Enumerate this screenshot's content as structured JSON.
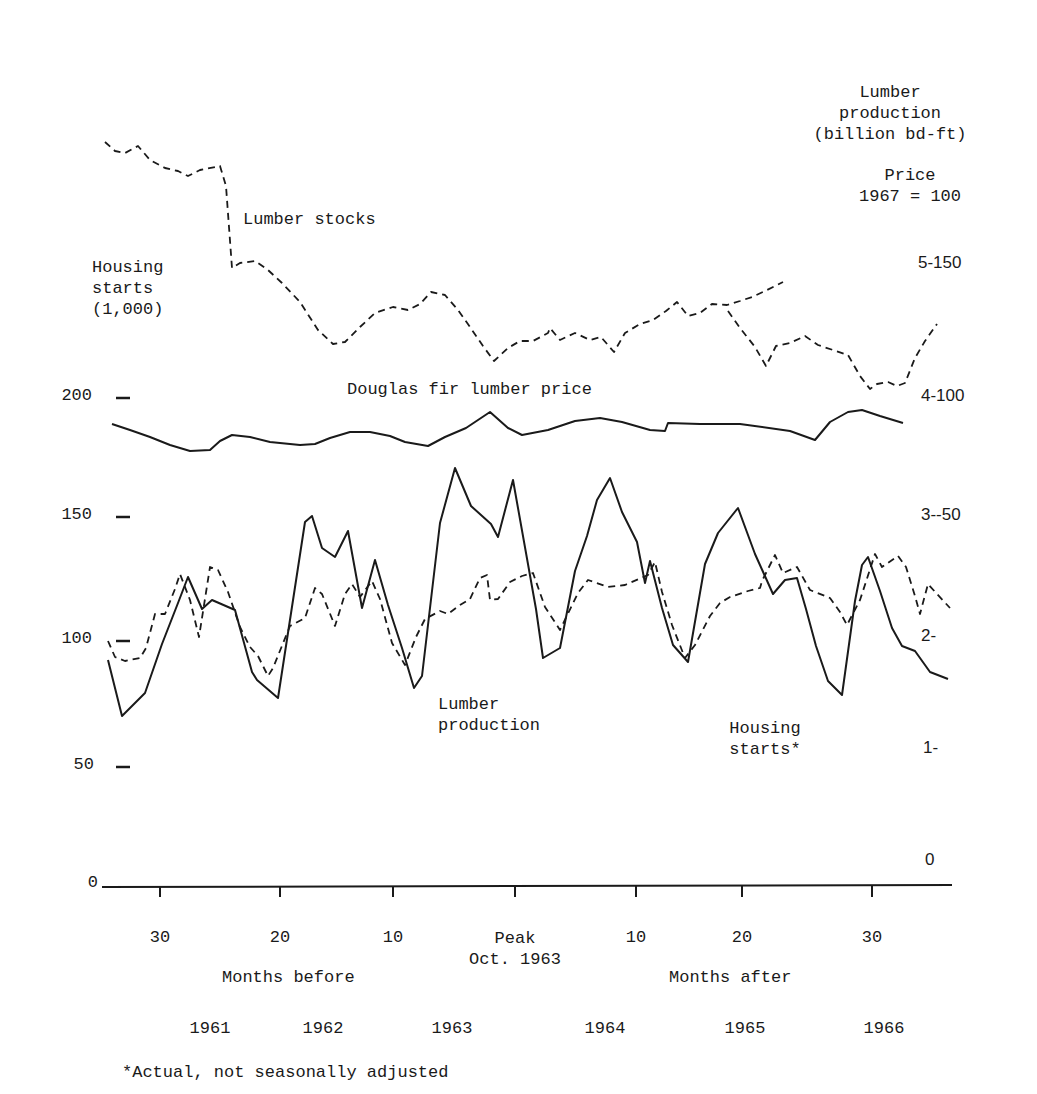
{
  "chart_data": {
    "type": "line",
    "title": "",
    "labels": {
      "right_axis_title_1": "Lumber\nproduction\n(billion bd-ft)",
      "right_axis_title_2": "Price\n1967 = 100",
      "left_axis_title": "Housing\nstarts\n(1,000)",
      "lumber_stocks": "Lumber stocks",
      "douglas_fir": "Douglas fir lumber price",
      "lumber_production": "Lumber\nproduction",
      "housing_starts": "Housing\nstarts*",
      "months_before": "Months before",
      "months_after": "Months after",
      "peak": "Peak\nOct. 1963",
      "footnote": "*Actual, not seasonally adjusted"
    },
    "left_axis": {
      "label": "Housing starts (1,000)",
      "ticks": [
        {
          "value": "200",
          "y": 398
        },
        {
          "value": "150",
          "y": 517
        },
        {
          "value": "100",
          "y": 641
        },
        {
          "value": "50",
          "y": 767
        },
        {
          "value": "0",
          "y": 885
        }
      ]
    },
    "right_axis": {
      "label": "Lumber production (billion bd-ft) / Price 1967 = 100",
      "ticks": [
        {
          "value": "5-150",
          "y": 265
        },
        {
          "value": "4-100",
          "y": 398
        },
        {
          "value": "3--50",
          "y": 517
        },
        {
          "value": "2-",
          "y": 638
        },
        {
          "value": "1-",
          "y": 750
        },
        {
          "value": "0",
          "y": 862
        }
      ]
    },
    "x_axis": {
      "ticks": [
        {
          "label": "30",
          "x": 160
        },
        {
          "label": "20",
          "x": 280
        },
        {
          "label": "10",
          "x": 393
        },
        {
          "label": "",
          "x": 515
        },
        {
          "label": "10",
          "x": 636
        },
        {
          "label": "20",
          "x": 742
        },
        {
          "label": "30",
          "x": 872
        }
      ],
      "peak_label": "Peak",
      "peak_date": "Oct. 1963",
      "years": [
        {
          "label": "1961",
          "x": 210
        },
        {
          "label": "1962",
          "x": 323
        },
        {
          "label": "1963",
          "x": 452
        },
        {
          "label": "1964",
          "x": 605
        },
        {
          "label": "1965",
          "x": 745
        },
        {
          "label": "1966",
          "x": 884
        }
      ]
    },
    "series": [
      {
        "name": "Lumber stocks",
        "style": "dashed",
        "points": [
          [
            105,
            142
          ],
          [
            115,
            151
          ],
          [
            125,
            153
          ],
          [
            138,
            146
          ],
          [
            150,
            160
          ],
          [
            165,
            168
          ],
          [
            178,
            171
          ],
          [
            188,
            176
          ],
          [
            200,
            170
          ],
          [
            220,
            166
          ],
          [
            226,
            186
          ],
          [
            232,
            268
          ],
          [
            240,
            263
          ],
          [
            255,
            261
          ],
          [
            268,
            270
          ],
          [
            282,
            283
          ],
          [
            300,
            302
          ],
          [
            318,
            330
          ],
          [
            333,
            344
          ],
          [
            345,
            342
          ],
          [
            360,
            327
          ],
          [
            375,
            313
          ],
          [
            393,
            307
          ],
          [
            408,
            310
          ],
          [
            420,
            304
          ],
          [
            431,
            292
          ],
          [
            445,
            295
          ],
          [
            458,
            310
          ],
          [
            470,
            327
          ],
          [
            483,
            346
          ],
          [
            494,
            361
          ],
          [
            508,
            348
          ],
          [
            520,
            341
          ],
          [
            533,
            341
          ],
          [
            548,
            333
          ],
          [
            550,
            328
          ],
          [
            560,
            340
          ],
          [
            575,
            333
          ],
          [
            590,
            340
          ],
          [
            601,
            337
          ],
          [
            614,
            352
          ],
          [
            625,
            333
          ],
          [
            640,
            324
          ],
          [
            653,
            320
          ],
          [
            666,
            311
          ],
          [
            677,
            302
          ],
          [
            688,
            316
          ],
          [
            700,
            313
          ],
          [
            712,
            304
          ],
          [
            727,
            305
          ],
          [
            740,
            301
          ],
          [
            752,
            297
          ],
          [
            765,
            291
          ],
          [
            783,
            282
          ]
        ],
        "color": "#1a1a1a"
      },
      {
        "name": "Lumber stocks (cont.)",
        "style": "dashed",
        "points": [
          [
            728,
            311
          ],
          [
            740,
            328
          ],
          [
            755,
            347
          ],
          [
            766,
            366
          ],
          [
            776,
            346
          ],
          [
            790,
            343
          ],
          [
            805,
            336
          ],
          [
            818,
            345
          ],
          [
            833,
            350
          ],
          [
            848,
            355
          ],
          [
            860,
            376
          ],
          [
            870,
            389
          ],
          [
            877,
            384
          ],
          [
            888,
            382
          ],
          [
            897,
            386
          ],
          [
            905,
            383
          ],
          [
            915,
            358
          ],
          [
            925,
            341
          ],
          [
            937,
            324
          ]
        ],
        "color": "#1a1a1a"
      },
      {
        "name": "Douglas fir lumber price",
        "style": "solid",
        "points": [
          [
            112,
            424
          ],
          [
            130,
            430
          ],
          [
            150,
            437
          ],
          [
            170,
            445
          ],
          [
            190,
            451
          ],
          [
            210,
            450
          ],
          [
            220,
            441
          ],
          [
            232,
            435
          ],
          [
            250,
            437
          ],
          [
            270,
            442
          ],
          [
            280,
            443
          ],
          [
            300,
            445
          ],
          [
            315,
            444
          ],
          [
            330,
            438
          ],
          [
            350,
            432
          ],
          [
            370,
            432
          ],
          [
            390,
            436
          ],
          [
            405,
            442
          ],
          [
            428,
            446
          ],
          [
            445,
            437
          ],
          [
            466,
            428
          ],
          [
            490,
            412
          ],
          [
            508,
            428
          ],
          [
            522,
            435
          ],
          [
            548,
            430
          ],
          [
            575,
            421
          ],
          [
            600,
            418
          ],
          [
            622,
            422
          ],
          [
            650,
            430
          ],
          [
            665,
            431
          ],
          [
            668,
            423
          ],
          [
            700,
            424
          ],
          [
            740,
            424
          ],
          [
            790,
            431
          ],
          [
            815,
            440
          ],
          [
            830,
            422
          ],
          [
            848,
            412
          ],
          [
            862,
            410
          ],
          [
            880,
            416
          ],
          [
            903,
            423
          ]
        ],
        "color": "#1a1a1a"
      },
      {
        "name": "Housing starts*",
        "style": "solid",
        "points": [
          [
            108,
            660
          ],
          [
            122,
            716
          ],
          [
            145,
            693
          ],
          [
            162,
            644
          ],
          [
            178,
            603
          ],
          [
            188,
            577
          ],
          [
            202,
            609
          ],
          [
            212,
            600
          ],
          [
            235,
            610
          ],
          [
            252,
            672
          ],
          [
            257,
            680
          ],
          [
            278,
            698
          ],
          [
            305,
            522
          ],
          [
            312,
            516
          ],
          [
            322,
            548
          ],
          [
            335,
            557
          ],
          [
            348,
            531
          ],
          [
            362,
            608
          ],
          [
            375,
            560
          ],
          [
            388,
            605
          ],
          [
            402,
            648
          ],
          [
            414,
            688
          ],
          [
            422,
            676
          ],
          [
            440,
            523
          ],
          [
            455,
            468
          ],
          [
            471,
            506
          ],
          [
            491,
            524
          ],
          [
            498,
            537
          ],
          [
            513,
            480
          ],
          [
            536,
            609
          ],
          [
            543,
            658
          ],
          [
            560,
            648
          ],
          [
            575,
            571
          ],
          [
            587,
            536
          ],
          [
            597,
            500
          ],
          [
            610,
            478
          ],
          [
            622,
            512
          ],
          [
            637,
            542
          ],
          [
            645,
            583
          ],
          [
            650,
            561
          ],
          [
            662,
            608
          ],
          [
            673,
            645
          ],
          [
            688,
            662
          ],
          [
            705,
            564
          ],
          [
            718,
            533
          ],
          [
            738,
            508
          ],
          [
            755,
            554
          ],
          [
            773,
            594
          ],
          [
            785,
            580
          ],
          [
            797,
            578
          ],
          [
            806,
            609
          ],
          [
            816,
            646
          ],
          [
            828,
            681
          ],
          [
            842,
            695
          ],
          [
            855,
            601
          ],
          [
            862,
            565
          ],
          [
            868,
            557
          ],
          [
            880,
            591
          ],
          [
            892,
            628
          ],
          [
            902,
            646
          ],
          [
            915,
            651
          ],
          [
            930,
            672
          ],
          [
            948,
            679
          ]
        ],
        "color": "#1a1a1a"
      },
      {
        "name": "Lumber production",
        "style": "dashed",
        "points": [
          [
            108,
            641
          ],
          [
            115,
            657
          ],
          [
            125,
            661
          ],
          [
            140,
            658
          ],
          [
            146,
            648
          ],
          [
            155,
            614
          ],
          [
            165,
            614
          ],
          [
            175,
            589
          ],
          [
            180,
            574
          ],
          [
            190,
            600
          ],
          [
            199,
            637
          ],
          [
            210,
            567
          ],
          [
            218,
            570
          ],
          [
            228,
            592
          ],
          [
            240,
            627
          ],
          [
            250,
            647
          ],
          [
            258,
            656
          ],
          [
            268,
            676
          ],
          [
            273,
            668
          ],
          [
            290,
            626
          ],
          [
            305,
            618
          ],
          [
            315,
            588
          ],
          [
            322,
            594
          ],
          [
            335,
            626
          ],
          [
            345,
            594
          ],
          [
            352,
            584
          ],
          [
            360,
            597
          ],
          [
            372,
            581
          ],
          [
            380,
            599
          ],
          [
            392,
            643
          ],
          [
            405,
            665
          ],
          [
            416,
            637
          ],
          [
            425,
            619
          ],
          [
            440,
            611
          ],
          [
            448,
            614
          ],
          [
            460,
            605
          ],
          [
            470,
            599
          ],
          [
            480,
            578
          ],
          [
            487,
            575
          ],
          [
            490,
            600
          ],
          [
            498,
            599
          ],
          [
            510,
            582
          ],
          [
            522,
            576
          ],
          [
            533,
            573
          ],
          [
            545,
            607
          ],
          [
            560,
            630
          ],
          [
            578,
            593
          ],
          [
            588,
            580
          ],
          [
            608,
            587
          ],
          [
            625,
            585
          ],
          [
            648,
            575
          ],
          [
            655,
            562
          ],
          [
            662,
            592
          ],
          [
            672,
            625
          ],
          [
            685,
            658
          ],
          [
            695,
            645
          ],
          [
            710,
            616
          ],
          [
            720,
            603
          ],
          [
            730,
            597
          ],
          [
            748,
            591
          ],
          [
            760,
            588
          ],
          [
            762,
            581
          ],
          [
            775,
            555
          ],
          [
            783,
            573
          ],
          [
            797,
            567
          ],
          [
            810,
            590
          ],
          [
            830,
            598
          ],
          [
            840,
            612
          ],
          [
            847,
            625
          ],
          [
            860,
            600
          ],
          [
            875,
            554
          ],
          [
            882,
            567
          ],
          [
            898,
            556
          ],
          [
            906,
            567
          ],
          [
            915,
            596
          ],
          [
            920,
            614
          ],
          [
            928,
            584
          ],
          [
            937,
            594
          ],
          [
            950,
            608
          ]
        ],
        "color": "#1a1a1a"
      }
    ],
    "axis_color": "#1a1a1a"
  }
}
